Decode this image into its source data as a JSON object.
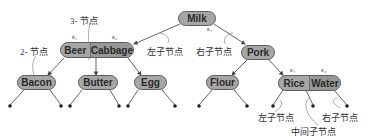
{
  "diagram": {
    "type": "b-tree",
    "nodes": {
      "root": {
        "keys": [
          "Milk"
        ],
        "key_label": "κ₁"
      },
      "left": {
        "keys": [
          "Beer",
          "Cabbage"
        ],
        "key_labels": [
          "κ₁",
          "κ₂"
        ]
      },
      "right": {
        "keys": [
          "Pork"
        ]
      },
      "ll": {
        "keys": [
          "Bacon"
        ]
      },
      "lm": {
        "keys": [
          "Butter"
        ]
      },
      "lr": {
        "keys": [
          "Egg"
        ]
      },
      "rl": {
        "keys": [
          "Flour"
        ]
      },
      "rr": {
        "keys": [
          "Rice",
          "Water"
        ],
        "key_labels": [
          "κ₁",
          "κ₂"
        ]
      }
    },
    "annotations": {
      "three_node": "3- 节点",
      "two_node": "2- 节点",
      "left_child_top": "左子节点",
      "right_child_top": "右子节点",
      "left_child_bottom": "左子节点",
      "middle_child_bottom": "中间子节点",
      "right_child_bottom": "右子节点"
    }
  }
}
